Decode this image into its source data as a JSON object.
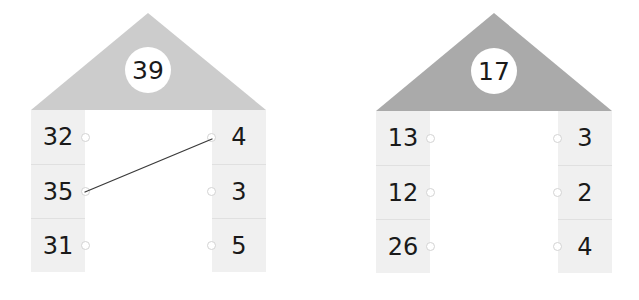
{
  "page": {
    "background_color": "#ffffff"
  },
  "colors": {
    "cell_background": "#f0f0f0",
    "cell_divider": "#e0e0e0",
    "badge_background": "#ffffff",
    "number_text": "#1a1a1a",
    "dot_fill": "#ffffff",
    "dot_stroke": "#d3d3d3",
    "link_line": "#3a3a3a"
  },
  "houses": [
    {
      "id": "house-left",
      "target": "39",
      "roof_color": "#cccccc",
      "left_column": {
        "cells": [
          {
            "value": "32",
            "dot": "node-left-0"
          },
          {
            "value": "35",
            "dot": "node-left-1"
          },
          {
            "value": "31",
            "dot": "node-left-2"
          }
        ]
      },
      "right_column": {
        "cells": [
          {
            "value": "4",
            "dot": "node-right-0"
          },
          {
            "value": "3",
            "dot": "node-right-1"
          },
          {
            "value": "5",
            "dot": "node-right-2"
          }
        ]
      },
      "links": [
        {
          "from": "35",
          "to": "4",
          "from_row": 1,
          "to_row": 0
        }
      ]
    },
    {
      "id": "house-right",
      "target": "17",
      "roof_color": "#aaaaaa",
      "left_column": {
        "cells": [
          {
            "value": "13",
            "dot": "node-left-0"
          },
          {
            "value": "12",
            "dot": "node-left-1"
          },
          {
            "value": "26",
            "dot": "node-left-2"
          }
        ]
      },
      "right_column": {
        "cells": [
          {
            "value": "3",
            "dot": "node-right-0"
          },
          {
            "value": "2",
            "dot": "node-right-1"
          },
          {
            "value": "4",
            "dot": "node-right-2"
          }
        ]
      },
      "links": []
    }
  ]
}
